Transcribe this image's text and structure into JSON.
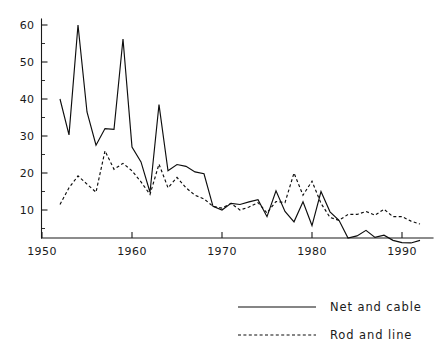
{
  "chart_data": {
    "type": "line",
    "title": "",
    "subtitle": "",
    "xlabel": "",
    "ylabel": "",
    "xlim": [
      1950,
      1993
    ],
    "ylim": [
      0,
      62
    ],
    "grid": false,
    "legend_position": "bottom-right",
    "x_ticks": [
      1950,
      1960,
      1970,
      1980,
      1990
    ],
    "x_tick_labels": [
      "1950",
      "1960",
      "1970",
      "1980",
      "1990"
    ],
    "x_minor_ticks": [
      1955,
      1965,
      1975,
      1985
    ],
    "y_ticks": [
      10,
      20,
      30,
      40,
      50,
      60
    ],
    "y_tick_labels": [
      "10",
      "20",
      "30",
      "40",
      "50",
      "60"
    ],
    "y_minor_ticks": [
      5,
      15,
      25,
      35,
      45,
      55
    ],
    "x": [
      1952,
      1953,
      1954,
      1955,
      1956,
      1957,
      1958,
      1959,
      1960,
      1961,
      1962,
      1963,
      1964,
      1965,
      1966,
      1967,
      1968,
      1969,
      1970,
      1971,
      1972,
      1973,
      1974,
      1975,
      1976,
      1977,
      1978,
      1979,
      1980,
      1981,
      1982,
      1983,
      1984,
      1985,
      1986,
      1987,
      1988,
      1989,
      1990,
      1991,
      1992
    ],
    "series": [
      {
        "name": "Net and cable",
        "style": "solid",
        "color": "#0d0d0d",
        "values": [
          40.0,
          30.3,
          60.0,
          36.5,
          27.5,
          32.0,
          31.8,
          56.2,
          27.0,
          23.0,
          14.8,
          38.5,
          20.6,
          22.3,
          21.8,
          20.3,
          19.8,
          11.0,
          10.0,
          11.8,
          11.5,
          12.2,
          12.8,
          8.2,
          15.2,
          9.6,
          6.8,
          12.2,
          5.8,
          15.0,
          9.5,
          7.2,
          2.4,
          3.0,
          4.5,
          2.6,
          3.2,
          1.8,
          1.2,
          1.1,
          1.8
        ]
      },
      {
        "name": "Rod and line",
        "style": "dashed",
        "color": "#0d0d0d",
        "values": [
          11.5,
          16.0,
          19.2,
          17.0,
          14.8,
          26.0,
          21.0,
          22.6,
          20.6,
          17.6,
          14.2,
          22.4,
          16.0,
          18.8,
          16.0,
          14.0,
          13.0,
          11.0,
          10.5,
          11.8,
          10.0,
          10.8,
          12.0,
          9.2,
          12.3,
          12.0,
          20.0,
          14.0,
          17.8,
          11.8,
          8.0,
          7.2,
          8.8,
          8.8,
          9.6,
          8.6,
          10.2,
          8.2,
          8.2,
          7.0,
          6.2
        ]
      }
    ],
    "legend": [
      {
        "label": "Net and cable",
        "style": "solid"
      },
      {
        "label": "Rod and line",
        "style": "dashed"
      }
    ]
  }
}
